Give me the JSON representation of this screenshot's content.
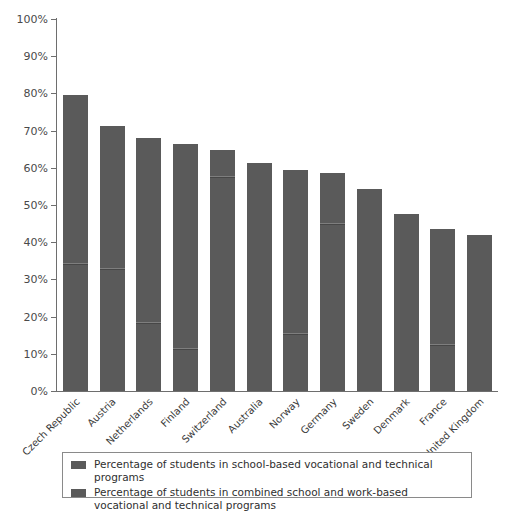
{
  "chart_data": {
    "type": "bar",
    "title": "",
    "subtitle": "",
    "xlabel": "",
    "ylabel": "",
    "ylim": [
      0,
      100
    ],
    "grid": false,
    "stacked": true,
    "legend_position": "bottom",
    "y_ticks": [
      "0%",
      "10%",
      "20%",
      "30%",
      "40%",
      "50%",
      "60%",
      "70%",
      "80%",
      "90%",
      "100%"
    ],
    "y_tick_values": [
      0,
      10,
      20,
      30,
      40,
      50,
      60,
      70,
      80,
      90,
      100
    ],
    "categories": [
      "Czech Republic",
      "Austria",
      "Netherlands",
      "Finland",
      "Switzerland",
      "Australia",
      "Norway",
      "Germany",
      "Sweden",
      "Denmark",
      "France",
      "United Kingdom"
    ],
    "series": [
      {
        "name": "Percentage of students in combined school and work-based vocational and technical programs",
        "values": [
          34,
          32.5,
          18,
          11,
          57.3,
          0,
          15,
          44.5,
          0,
          0,
          12,
          0
        ],
        "color": "#5a5a5a"
      },
      {
        "name": "Percentage of students in school-based vocational and technical programs",
        "values": [
          45.5,
          38.8,
          50,
          55.3,
          7.5,
          61.3,
          44.5,
          14,
          54.4,
          47.5,
          31.5,
          42
        ],
        "color": "#5a5a5a"
      }
    ],
    "totals": [
      79.5,
      71.3,
      68,
      66.3,
      64.8,
      61.3,
      59.5,
      58.5,
      54.4,
      47.5,
      43.5,
      42
    ],
    "dividers": [
      34,
      32.5,
      18,
      11,
      57.3,
      null,
      15,
      44.5,
      null,
      null,
      12,
      null
    ]
  },
  "legend": {
    "items": [
      {
        "label": "Percentage of students in school-based vocational and technical programs",
        "color": "#5a5a5a"
      },
      {
        "label": "Percentage of students in combined school and work-based vocational and technical programs",
        "color": "#5a5a5a"
      }
    ]
  }
}
